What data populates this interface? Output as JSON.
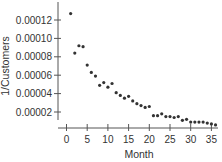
{
  "chart_data": {
    "type": "scatter",
    "title": "",
    "xlabel": "Month",
    "ylabel": "1/Customers",
    "xlim": [
      0,
      36
    ],
    "ylim": [
      0,
      0.00013
    ],
    "grid": false,
    "legend": null,
    "x_ticks": [
      0,
      5,
      10,
      15,
      20,
      25,
      30,
      35
    ],
    "x_tick_labels": [
      "0",
      "5",
      "10",
      "15",
      "20",
      "25",
      "30",
      "35"
    ],
    "y_ticks": [
      2e-05,
      4e-05,
      6e-05,
      8e-05,
      0.0001,
      0.00012
    ],
    "y_tick_labels": [
      "0.00002",
      "0.00004",
      "0.00006",
      "0.00008",
      "0.00010",
      "0.00012"
    ],
    "point_color": "#333333",
    "x": [
      1,
      2,
      3,
      4,
      5,
      6,
      7,
      8,
      9,
      10,
      11,
      12,
      13,
      14,
      15,
      16,
      17,
      18,
      19,
      20,
      21,
      22,
      23,
      24,
      25,
      26,
      27,
      28,
      29,
      30,
      31,
      32,
      33,
      34,
      35,
      36
    ],
    "y": [
      0.000127,
      8.4e-05,
      9.2e-05,
      9.1e-05,
      7.1e-05,
      6.3e-05,
      5.9e-05,
      4.9e-05,
      5.2e-05,
      4.7e-05,
      5.1e-05,
      4.1e-05,
      3.8e-05,
      3.5e-05,
      3.7e-05,
      3.2e-05,
      2.9e-05,
      2.7e-05,
      2.5e-05,
      2.6e-05,
      1.6e-05,
      1.6e-05,
      1.8e-05,
      1.5e-05,
      1.5e-05,
      1.4e-05,
      1.5e-05,
      1.1e-05,
      1.2e-05,
      9e-06,
      9e-06,
      9e-06,
      9e-06,
      8e-06,
      7e-06,
      6e-06
    ]
  }
}
